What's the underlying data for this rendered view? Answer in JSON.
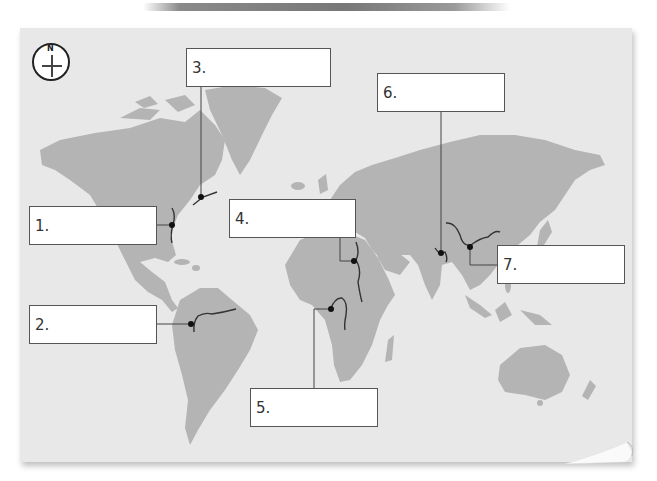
{
  "worksheet": {
    "compass": {
      "label": "N"
    },
    "colors": {
      "panel": "#e8e8e8",
      "land": "#b4b4b4",
      "river": "#333333",
      "box_border": "#555555"
    },
    "label_boxes": [
      {
        "number": "1.",
        "value": ""
      },
      {
        "number": "2.",
        "value": ""
      },
      {
        "number": "3.",
        "value": ""
      },
      {
        "number": "4.",
        "value": ""
      },
      {
        "number": "5.",
        "value": ""
      },
      {
        "number": "6.",
        "value": ""
      },
      {
        "number": "7.",
        "value": ""
      }
    ]
  }
}
